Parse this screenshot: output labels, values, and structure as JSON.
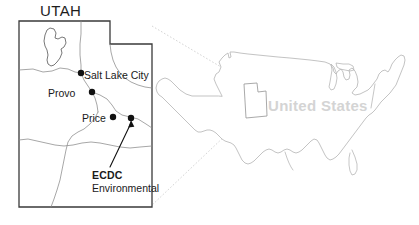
{
  "figure": {
    "kind": "locator-map",
    "width": 419,
    "height": 225,
    "background": "#ffffff"
  },
  "inset": {
    "title": "UTAH",
    "border_color": "#3a3a3a",
    "interior_line_color": "#8a8a8a",
    "marker_color": "#111111",
    "cities": [
      {
        "name": "Salt Lake City",
        "label": "Salt Lake City",
        "x": 81,
        "y": 73,
        "dot": true
      },
      {
        "name": "Provo",
        "label": "Provo",
        "x": 92,
        "y": 92,
        "dot": true
      },
      {
        "name": "Price",
        "label": "Price",
        "x": 113,
        "y": 117,
        "dot": true
      }
    ],
    "site": {
      "label_line1": "ECDC",
      "label_line2": "Environmental",
      "x": 131,
      "y": 119,
      "dot": true,
      "leader_from_x": 110,
      "leader_from_y": 168
    },
    "lake": {
      "name": "Great Salt Lake"
    }
  },
  "national": {
    "label": "United States",
    "label_color": "#d4d4d4",
    "outline_color": "#b8b8b8",
    "highlight": {
      "name": "Utah",
      "outline_color": "#9a9a9a"
    }
  },
  "connectors": {
    "style": "dotted",
    "color": "#cccccc",
    "count": 2
  }
}
